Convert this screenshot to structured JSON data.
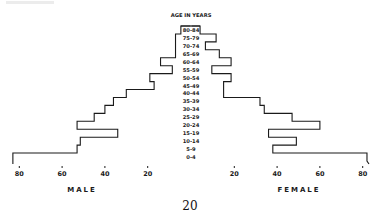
{
  "chart_data": {
    "type": "bar",
    "subtype": "population-pyramid",
    "title": "AGE IN YEARS",
    "categories": [
      "80-84",
      "75-79",
      "70-74",
      "65-69",
      "60-64",
      "55-59",
      "50-54",
      "45-49",
      "40-44",
      "35-39",
      "30-34",
      "25-29",
      "20-24",
      "15-19",
      "10-14",
      "5-9",
      "0-4"
    ],
    "series": [
      {
        "name": "MALE",
        "side": "left",
        "values": [
          4.5,
          7,
          7,
          7,
          14,
          8.5,
          19,
          17,
          30,
          36,
          40,
          45,
          53,
          34,
          51.5,
          53,
          83
        ]
      },
      {
        "name": "FEMALE",
        "side": "right",
        "values": [
          4,
          11.5,
          6.5,
          13,
          18.5,
          9.5,
          18.5,
          15,
          15,
          32,
          34,
          47,
          60,
          36,
          49,
          38,
          82
        ]
      }
    ],
    "x_axis": {
      "male_ticks": [
        "80",
        "60",
        "40",
        "20"
      ],
      "female_ticks": [
        "20",
        "40",
        "60",
        "80"
      ],
      "range": [
        0,
        85
      ]
    },
    "xlabel_left": "MALE",
    "xlabel_right": "FEMALE",
    "grid": false,
    "legend": "none"
  },
  "page": {
    "number": "20"
  }
}
